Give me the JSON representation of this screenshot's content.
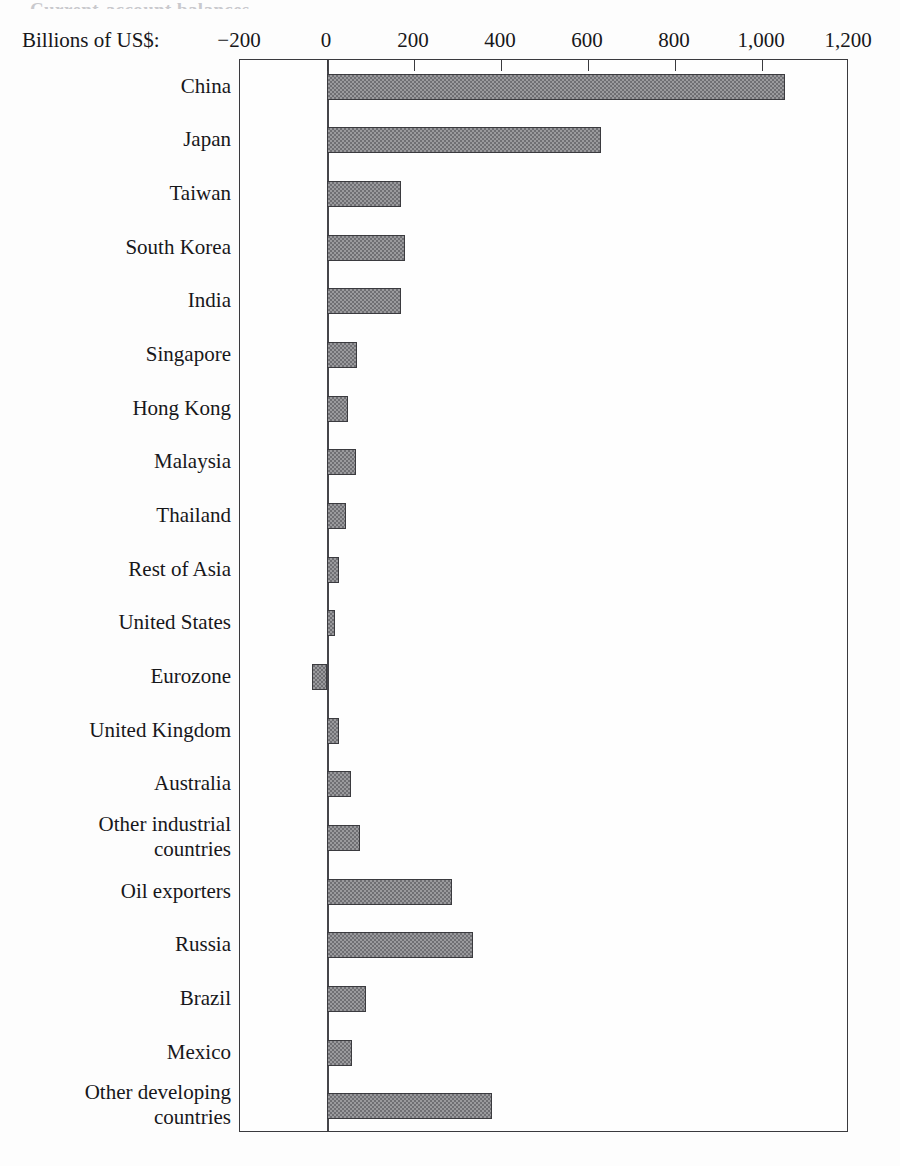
{
  "figure": {
    "cut_off_title": "Current-account balances",
    "axis_units_label": "Billions of US$:"
  },
  "chart_data": {
    "type": "bar",
    "orientation": "horizontal",
    "title": "",
    "xlabel": "Billions of US$:",
    "ylabel": "",
    "xlim": [
      -200,
      1200
    ],
    "xticks": [
      -200,
      0,
      200,
      400,
      600,
      800,
      1000,
      1200
    ],
    "xtick_labels": [
      "−200",
      "0",
      "200",
      "400",
      "600",
      "800",
      "1,000",
      "1,200"
    ],
    "grid": false,
    "legend": null,
    "bar_color": "#6f6f73",
    "bar_edge_color": "#3b3b3f",
    "categories": [
      "China",
      "Japan",
      "Taiwan",
      "South Korea",
      "India",
      "Singapore",
      "Hong Kong",
      "Malaysia",
      "Thailand",
      "Rest of Asia",
      "United States",
      "Eurozone",
      "United Kingdom",
      "Australia",
      "Other industrial\ncountries",
      "Oil exporters",
      "Russia",
      "Brazil",
      "Mexico",
      "Other developing\ncountries"
    ],
    "values": [
      1053,
      630,
      170,
      180,
      170,
      69,
      48,
      67,
      44,
      28,
      18,
      -35,
      28,
      55,
      75,
      288,
      336,
      90,
      58,
      380
    ]
  }
}
